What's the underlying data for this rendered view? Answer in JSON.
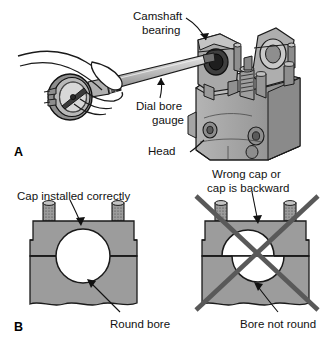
{
  "figure": {
    "background_color": "#ffffff",
    "width": 332,
    "height": 344
  },
  "palette": {
    "outline": "#1a1a1a",
    "metal_light": "#d0d0d0",
    "metal_mid": "#9c9c9c",
    "metal_dark": "#6e6e6e",
    "metal_darker": "#4f4f4f",
    "bore_white": "#ffffff",
    "x_mark": "#595959",
    "text": "#111111"
  },
  "panels": [
    {
      "id": "A",
      "letter": "A",
      "description": "Technician using a dial bore gauge to measure a camshaft bearing bore in a cylinder head",
      "labels": [
        {
          "name": "camshaft-bearing",
          "lines": [
            "Camshaft",
            "bearing"
          ],
          "text": "Camshaft bearing"
        },
        {
          "name": "dial-bore-gauge",
          "lines": [
            "Dial bore",
            "gauge"
          ],
          "text": "Dial bore gauge"
        },
        {
          "name": "head",
          "lines": [
            "Head"
          ],
          "text": "Head"
        }
      ]
    },
    {
      "id": "B",
      "letter": "B",
      "description": "Comparison of a correctly installed bearing cap producing a round bore versus a wrong or backward cap producing an out-of-round bore",
      "items": [
        {
          "name": "cap-correct",
          "top_label": "Cap installed correctly",
          "bottom_label": "Round bore",
          "status": "correct",
          "marked_wrong": false
        },
        {
          "name": "cap-wrong",
          "top_label_lines": [
            "Wrong cap or",
            "cap is backward"
          ],
          "top_label": "Wrong cap or cap is backward",
          "bottom_label": "Bore not round",
          "status": "incorrect",
          "marked_wrong": true
        }
      ]
    }
  ],
  "labels": {
    "camshaft_bearing_line1": "Camshaft",
    "camshaft_bearing_line2": "bearing",
    "dial_bore_gauge_line1": "Dial bore",
    "dial_bore_gauge_line2": "gauge",
    "head": "Head",
    "panel_a_letter": "A",
    "panel_b_letter": "B",
    "cap_installed_correctly": "Cap installed correctly",
    "round_bore": "Round bore",
    "wrong_cap_line1": "Wrong cap or",
    "wrong_cap_line2": "cap is backward",
    "bore_not_round": "Bore not round"
  }
}
